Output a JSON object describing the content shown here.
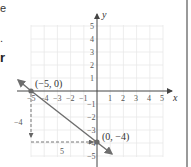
{
  "text_fragments": {
    "top": "e",
    "middle": ".",
    "bold": "r"
  },
  "graph": {
    "x_axis_label": "x",
    "y_axis_label": "y",
    "x_ticks": [
      "−5",
      "−4",
      "−3",
      "−2",
      "−1",
      "1",
      "2",
      "3",
      "4",
      "5"
    ],
    "y_ticks": [
      "5",
      "4",
      "3",
      "2",
      "1",
      "−1",
      "−2",
      "−3",
      "−4",
      "−5"
    ],
    "points": [
      {
        "label": "(−5, 0)",
        "x": -5,
        "y": 0
      },
      {
        "label": "(0, −4)",
        "x": 0,
        "y": -4
      }
    ],
    "rise_label": "−4",
    "run_label": "5",
    "colors": {
      "line": "#6e6e6e",
      "point": "#6a6a6a",
      "axis": "#555555",
      "grid": "#e6e6e6",
      "dashed": "#777777"
    }
  }
}
